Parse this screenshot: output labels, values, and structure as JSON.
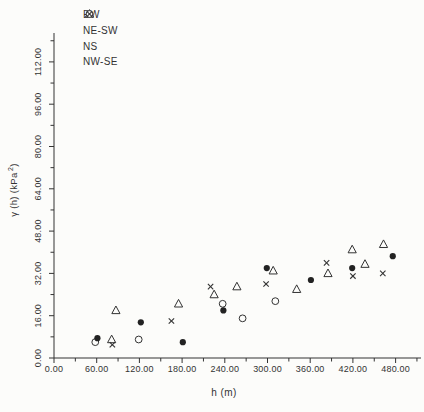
{
  "figure": {
    "background": "#fcfcfa",
    "ink": "#333333",
    "marker_fill": "#222222",
    "open_marker_fill": "#fcfcfa"
  },
  "chart_data": {
    "type": "scatter",
    "title": "",
    "xlabel": "h (m)",
    "ylabel": "γ (h) (kPa²)",
    "ylabel_parts": {
      "main": "γ (h) (kPa",
      "sup": "2",
      "end": ")"
    },
    "xlim": [
      0,
      510
    ],
    "ylim": [
      0,
      120
    ],
    "x_major_step": 60,
    "x_minor_step": 30,
    "y_major_step": 16,
    "y_minor_step": 8,
    "x_tick_labels": [
      "0.00",
      "60.00",
      "120.00",
      "180.00",
      "240.00",
      "300.00",
      "360.00",
      "420.00",
      "480.00"
    ],
    "y_tick_labels": [
      "0.00",
      "16.00",
      "32.00",
      "48.00",
      "64.00",
      "80.00",
      "96.00",
      "112.00"
    ],
    "grid": false,
    "legend_position": "top-left",
    "legend": [
      "EW",
      "NE-SW",
      "NS",
      "NW-SE"
    ],
    "series": [
      {
        "name": "NE-SW",
        "marker": "open-triangle",
        "points": [
          [
            81,
            7
          ],
          [
            87,
            18
          ],
          [
            175,
            20.5
          ],
          [
            225,
            24
          ],
          [
            257,
            27
          ],
          [
            308,
            33
          ],
          [
            341,
            26
          ],
          [
            385,
            32
          ],
          [
            419,
            41
          ],
          [
            437,
            35.5
          ],
          [
            463,
            43
          ]
        ]
      },
      {
        "name": "NS",
        "marker": "open-circle",
        "points": [
          [
            58,
            6
          ],
          [
            119,
            7
          ],
          [
            237,
            20.5
          ],
          [
            265,
            15
          ],
          [
            311,
            21.5
          ]
        ]
      },
      {
        "name": "NW-SE",
        "marker": "x-cross",
        "points": [
          [
            82,
            5
          ],
          [
            165,
            14
          ],
          [
            220,
            27
          ],
          [
            298,
            28
          ],
          [
            383,
            36
          ],
          [
            420,
            31
          ],
          [
            462,
            32
          ]
        ]
      },
      {
        "name": "EW",
        "marker": "filled-circle",
        "points": [
          [
            61,
            7.5
          ],
          [
            122,
            13.5
          ],
          [
            181,
            6
          ],
          [
            238,
            18
          ],
          [
            299,
            34
          ],
          [
            361,
            29.5
          ],
          [
            419,
            34
          ],
          [
            476,
            38.5
          ]
        ]
      }
    ]
  }
}
